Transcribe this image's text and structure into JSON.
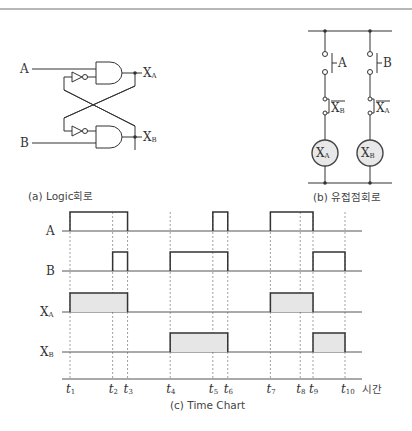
{
  "captions": {
    "logic": "(a) Logic회로",
    "relay": "(b) 유접점회로",
    "timechart": "(c) Time Chart"
  },
  "logic_circuit": {
    "inputs": [
      "A",
      "B"
    ],
    "outputs": [
      {
        "main": "X",
        "sub": "A"
      },
      {
        "main": "X",
        "sub": "B"
      }
    ]
  },
  "relay_circuit": {
    "rungs": [
      {
        "switch_label": "A",
        "contact_main": "X",
        "contact_sub": "B",
        "coil_main": "X",
        "coil_sub": "A"
      },
      {
        "switch_label": "B",
        "contact_main": "X",
        "contact_sub": "A",
        "coil_main": "X",
        "coil_sub": "B"
      }
    ]
  },
  "chart_data": {
    "type": "timing",
    "title": "(c) Time Chart",
    "xlabel": "시간",
    "time_ticks": [
      {
        "name": "t",
        "sub": "1"
      },
      {
        "name": "t",
        "sub": "2"
      },
      {
        "name": "t",
        "sub": "3"
      },
      {
        "name": "t",
        "sub": "4"
      },
      {
        "name": "t",
        "sub": "5"
      },
      {
        "name": "t",
        "sub": "6"
      },
      {
        "name": "t",
        "sub": "7"
      },
      {
        "name": "t",
        "sub": "8"
      },
      {
        "name": "t",
        "sub": "9"
      },
      {
        "name": "t",
        "sub": "10"
      }
    ],
    "tick_times": [
      0,
      1.0,
      1.35,
      2.35,
      3.35,
      3.7,
      4.7,
      5.4,
      5.7,
      6.45
    ],
    "series": [
      {
        "name": "A",
        "sub": "",
        "filled": false,
        "high_intervals": [
          [
            1,
            3
          ],
          [
            5,
            6
          ],
          [
            7,
            9
          ]
        ]
      },
      {
        "name": "B",
        "sub": "",
        "filled": false,
        "high_intervals": [
          [
            2,
            3
          ],
          [
            4,
            6
          ],
          [
            9,
            10
          ]
        ]
      },
      {
        "name": "X",
        "sub": "A",
        "filled": true,
        "high_intervals": [
          [
            1,
            3
          ],
          [
            7,
            9
          ]
        ]
      },
      {
        "name": "X",
        "sub": "B",
        "filled": true,
        "high_intervals": [
          [
            4,
            6
          ],
          [
            9,
            10
          ]
        ]
      }
    ]
  },
  "colors": {
    "line": "#333333",
    "fill": "#e6e6e6",
    "coil_fill": "#e8e8e8"
  }
}
